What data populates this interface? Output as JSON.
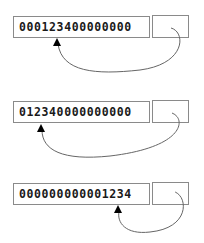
{
  "diagram": {
    "rows": [
      {
        "value": "000123400000000",
        "box_top": 16,
        "arrow_tip_x": 57
      },
      {
        "value": "012340000000000",
        "box_top": 101,
        "arrow_tip_x": 41
      },
      {
        "value": "000000000001234",
        "box_top": 183,
        "arrow_tip_x": 118
      }
    ],
    "colors": {
      "border": "#8a8a8a",
      "text": "#1a1a1a",
      "arrow": "#555555",
      "arrowhead": "#000000"
    }
  }
}
